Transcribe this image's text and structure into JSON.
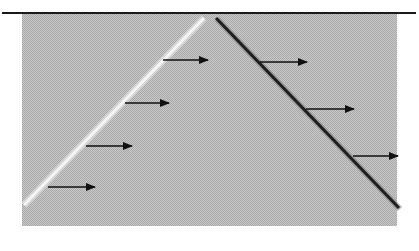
{
  "diagram": {
    "colors": {
      "background": "#ffffff",
      "region_fill": "#bdbdbd",
      "top_line": "#1a1a1a",
      "left_front": "#f5f5f5",
      "right_front": "#1e1e1e",
      "arrow": "#111111"
    },
    "top_line": {
      "x1": 2,
      "y1": 13,
      "x2": 416,
      "y2": 13
    },
    "region": {
      "x": 22,
      "y": 14,
      "width": 375,
      "height": 212
    },
    "left_front": {
      "x1": 24,
      "y1": 205,
      "x2": 204,
      "y2": 18
    },
    "right_front": {
      "x1": 216,
      "y1": 18,
      "x2": 399,
      "y2": 208
    },
    "arrows": [
      {
        "x1": 48,
        "y1": 187,
        "x2": 97,
        "y2": 187
      },
      {
        "x1": 86,
        "y1": 146,
        "x2": 134,
        "y2": 146
      },
      {
        "x1": 125,
        "y1": 103,
        "x2": 171,
        "y2": 103
      },
      {
        "x1": 163,
        "y1": 60,
        "x2": 210,
        "y2": 60
      },
      {
        "x1": 260,
        "y1": 62,
        "x2": 309,
        "y2": 62
      },
      {
        "x1": 306,
        "y1": 109,
        "x2": 356,
        "y2": 109
      },
      {
        "x1": 353,
        "y1": 156,
        "x2": 400,
        "y2": 156
      }
    ]
  }
}
